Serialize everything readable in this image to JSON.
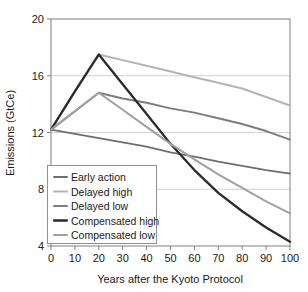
{
  "chart_data": {
    "type": "line",
    "title": "",
    "xlabel": "Years after the Kyoto Protocol",
    "ylabel": "Emissions (GtCe)",
    "xlim": [
      0,
      100
    ],
    "ylim": [
      4,
      20
    ],
    "xticks": [
      0,
      10,
      20,
      30,
      40,
      50,
      60,
      70,
      80,
      90,
      100
    ],
    "yticks": [
      4,
      8,
      12,
      16,
      20
    ],
    "xtick_labels": [
      "0",
      "10",
      "20",
      "30",
      "40",
      "50",
      "60",
      "70",
      "80",
      "90",
      "100"
    ],
    "ytick_labels": [
      "4",
      "8",
      "12",
      "16",
      "20"
    ],
    "grid": "horizontal",
    "gridlines_at": [
      8,
      12,
      16
    ],
    "legend_position": "lower-left",
    "x": [
      0,
      10,
      20,
      30,
      40,
      50,
      60,
      70,
      80,
      90,
      100
    ],
    "series": [
      {
        "name": "Early action",
        "color": "#6e6e6e",
        "width": 1.9,
        "values": [
          12.2,
          11.9,
          11.6,
          11.3,
          11.0,
          10.6,
          10.3,
          9.95,
          9.65,
          9.35,
          9.1
        ]
      },
      {
        "name": "Delayed high",
        "color": "#b4b4b4",
        "width": 2.0,
        "values": [
          12.2,
          14.9,
          17.5,
          17.1,
          16.7,
          16.3,
          15.9,
          15.5,
          15.1,
          14.5,
          13.9
        ]
      },
      {
        "name": "Delayed low",
        "color": "#7d7d7d",
        "width": 2.0,
        "values": [
          12.2,
          13.5,
          14.8,
          14.4,
          14.1,
          13.7,
          13.4,
          13.0,
          12.6,
          12.1,
          11.5
        ]
      },
      {
        "name": "Compensated high",
        "color": "#2b2b2b",
        "width": 2.3,
        "values": [
          12.2,
          14.9,
          17.5,
          15.4,
          13.3,
          11.2,
          9.35,
          7.75,
          6.45,
          5.3,
          4.3
        ]
      },
      {
        "name": "Compensated low",
        "color": "#a0a0a0",
        "width": 2.0,
        "values": [
          12.2,
          13.5,
          14.8,
          13.6,
          12.4,
          11.2,
          10.1,
          9.05,
          8.1,
          7.15,
          6.3
        ]
      }
    ]
  },
  "axes": {
    "ylabel": "Emissions (GtCe)",
    "xlabel": "Years after the Kyoto Protocol"
  },
  "legend": {
    "items": [
      {
        "label": "Early action"
      },
      {
        "label": "Delayed high"
      },
      {
        "label": "Delayed low"
      },
      {
        "label": "Compensated high"
      },
      {
        "label": "Compensated low"
      }
    ]
  },
  "style": {
    "frame_color": "#808080",
    "grid_color": "#d2d2d2",
    "text_color": "#1a1a1a",
    "background": "#ffffff"
  }
}
